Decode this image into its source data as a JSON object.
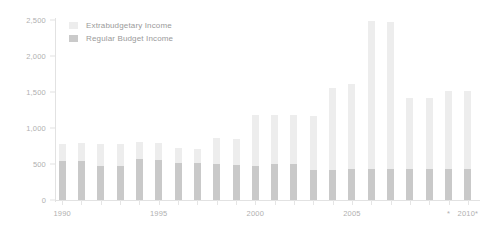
{
  "chart_data": {
    "type": "bar",
    "title": "",
    "subtitle": "",
    "xlabel": "",
    "ylabel": "",
    "stacked": true,
    "grid": false,
    "legend_position": "top-left",
    "ylim": [
      0,
      2500
    ],
    "yticks": [
      "0",
      "500",
      "1,000",
      "1,500",
      "2,000",
      "2,500"
    ],
    "ytick_values": [
      0,
      500,
      1000,
      1500,
      2000,
      2500
    ],
    "categories": [
      "1990",
      "1991",
      "1992",
      "1993",
      "1994",
      "1995",
      "1996",
      "1997",
      "1998",
      "1999",
      "2000",
      "2001",
      "2002",
      "2003",
      "2004",
      "2005",
      "2006",
      "2007",
      "2008",
      "2009",
      "2010",
      "2011"
    ],
    "xtick_labels": [
      {
        "category": "1990",
        "label": "1990"
      },
      {
        "category": "1995",
        "label": "1995"
      },
      {
        "category": "2000",
        "label": "2000"
      },
      {
        "category": "2005",
        "label": "2005"
      },
      {
        "category": "2010",
        "label": "*"
      },
      {
        "category": "2011",
        "label": "2010*"
      }
    ],
    "series": [
      {
        "name": "Extrabudgetary Income",
        "color": "#ededed",
        "values": [
          780,
          785,
          780,
          775,
          800,
          795,
          720,
          705,
          855,
          850,
          1180,
          1185,
          1180,
          1170,
          1560,
          1610,
          2490,
          2470,
          1410,
          1420,
          1520,
          1520
        ]
      },
      {
        "name": "Regular Budget Income",
        "color": "#c9c9c9",
        "values": [
          545,
          540,
          475,
          475,
          565,
          560,
          510,
          510,
          495,
          490,
          470,
          500,
          505,
          415,
          415,
          425,
          430,
          430,
          425,
          425,
          430,
          435
        ]
      }
    ]
  },
  "legend": {
    "items": [
      {
        "label": "Extrabudgetary Income",
        "swatch": "extra"
      },
      {
        "label": "Regular Budget Income",
        "swatch": "regular"
      }
    ]
  }
}
